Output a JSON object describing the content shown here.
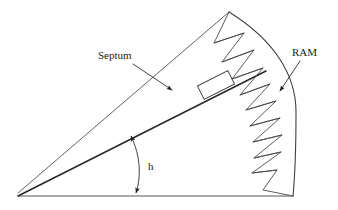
{
  "figure": {
    "background_color": "#ffffff",
    "width": 338,
    "height": 210,
    "line_color": "#3a3a3a",
    "septum_line_color": "#262626",
    "text_color": "#1a1a1a"
  },
  "labels": {
    "septum": "Septum",
    "ram": "RAM",
    "angle": "h"
  },
  "geometry": {
    "apex": {
      "x": 18,
      "y": 196
    },
    "baseline": {
      "x1": 18,
      "y1": 196,
      "x2": 293,
      "y2": 196
    },
    "upper_edge": {
      "x1": 18,
      "y1": 193,
      "x2": 229,
      "y2": 12
    },
    "septum_line": {
      "x1": 18,
      "y1": 196,
      "x2": 262,
      "y2": 73
    },
    "aperture_arc": {
      "start": {
        "x": 229,
        "y": 12
      },
      "end": {
        "x": 293,
        "y": 196
      },
      "bulge_x": 293,
      "bulge_y": 110
    },
    "septum_box": {
      "center_x": 216,
      "center_y": 85,
      "length": 34,
      "width": 15,
      "rotation_deg": -26.7
    },
    "angle_arc": {
      "vertex_x": 18,
      "vertex_y": 196,
      "radius": 118,
      "from_point": {
        "x": 130,
        "y": 135
      },
      "to_point": {
        "x": 136,
        "y": 195
      }
    },
    "ram_teeth_count": 13
  },
  "annotations": {
    "septum_leader": {
      "x1": 133,
      "y1": 62,
      "x2": 173,
      "y2": 91
    },
    "ram_leader": {
      "x1": 301,
      "y1": 60,
      "x2": 279,
      "y2": 92
    },
    "septum_text_pos": {
      "x": 98,
      "y": 60
    },
    "ram_text_pos": {
      "x": 292,
      "y": 56
    },
    "angle_text_pos": {
      "x": 148,
      "y": 168
    }
  }
}
